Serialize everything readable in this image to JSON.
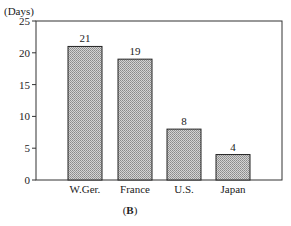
{
  "chart_data": {
    "type": "bar",
    "title": "",
    "caption": "(B)",
    "caption_parts": {
      "open": "(",
      "letter": "B",
      "close": ")"
    },
    "xlabel": "",
    "ylabel": "(Days)",
    "categories": [
      "W.Ger.",
      "France",
      "U.S.",
      "Japan"
    ],
    "values": [
      21,
      19,
      8,
      4
    ],
    "data_labels": [
      "21",
      "19",
      "8",
      "4"
    ],
    "ylim": [
      0,
      25
    ],
    "yticks": [
      0,
      5,
      10,
      15,
      20,
      25
    ],
    "ytick_labels": [
      "0",
      "5",
      "10",
      "15",
      "20",
      "25"
    ],
    "grid": false,
    "legend": null,
    "bar_fill": "#bdbdbd",
    "bar_pattern": "stippled",
    "axis_color": "#333333"
  }
}
